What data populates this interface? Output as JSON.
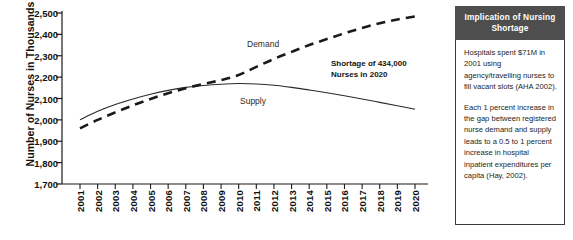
{
  "chart_data": {
    "type": "line",
    "title": "",
    "xlabel": "",
    "ylabel": "Number of Nurses in Thousands",
    "x": [
      2001,
      2002,
      2003,
      2004,
      2005,
      2006,
      2007,
      2008,
      2009,
      2010,
      2011,
      2012,
      2013,
      2014,
      2015,
      2016,
      2017,
      2018,
      2019,
      2020
    ],
    "xtick_labels": [
      "2001",
      "2002",
      "2003",
      "2004",
      "2005",
      "2006",
      "2007",
      "2008",
      "2009",
      "2010",
      "2011",
      "2012",
      "2013",
      "2014",
      "2015",
      "2016",
      "2017",
      "2018",
      "2019",
      "2020"
    ],
    "ytick_labels": [
      "2,500",
      "2,400",
      "2,300",
      "2,200",
      "2,100",
      "2,000",
      "1,900",
      "1,800",
      "1,700"
    ],
    "ytick_values": [
      2500,
      2400,
      2300,
      2200,
      2100,
      2000,
      1900,
      1800,
      1700
    ],
    "ylim": [
      1700,
      2500
    ],
    "xlim": [
      2001,
      2020
    ],
    "grid": false,
    "legend_position": "inline-labels",
    "series": [
      {
        "name": "Demand",
        "style": "dashed",
        "color": "#1a1a1a",
        "values": [
          1960,
          2000,
          2035,
          2068,
          2098,
          2125,
          2148,
          2168,
          2186,
          2210,
          2248,
          2285,
          2318,
          2350,
          2378,
          2405,
          2430,
          2452,
          2470,
          2484
        ]
      },
      {
        "name": "Supply",
        "style": "solid",
        "color": "#2a2a2a",
        "values": [
          2000,
          2040,
          2072,
          2098,
          2120,
          2138,
          2152,
          2161,
          2167,
          2170,
          2168,
          2162,
          2152,
          2140,
          2127,
          2113,
          2098,
          2082,
          2066,
          2050
        ]
      }
    ],
    "annotations": [
      {
        "name": "shortage-annotation",
        "line1": "Shortage of 434,000",
        "line2": "Nurses in 2020",
        "shortage_value": 434000,
        "shortage_year": 2020
      }
    ]
  },
  "chart": {
    "y_axis_title": "Number of Nurses in Thousands",
    "demand_label": "Demand",
    "supply_label": "Supply"
  },
  "callout": {
    "title_line1": "Implication of Nursing",
    "title_line2": "Shortage",
    "header_bg": "#4e4e4e",
    "paragraphs": [
      "Hospitals spent $71M in 2001 using agency/travelling nurses to fill vacant slots (AHA 2002).",
      "Each 1 percent increase in the gap between registered nurse demand and supply leads to a 0.5 to 1 percent increase in hospital inpatient expenditures per capita (Hay, 2002)."
    ]
  }
}
